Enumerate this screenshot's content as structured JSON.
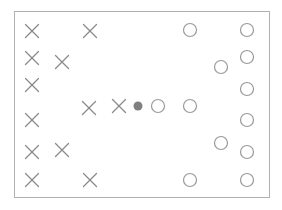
{
  "figure": {
    "title": "",
    "width": 282,
    "height": 210
  },
  "colors": {
    "background": "#ffffff",
    "border_stroke": "#b0b0b0",
    "cross_stroke": "#8a8a8a",
    "circle_stroke": "#9a9a9a",
    "query_fill": "#808080"
  },
  "frame": {
    "x": 14,
    "y": 11,
    "width": 255,
    "height": 186,
    "stroke_width": 1
  },
  "legend": {
    "entries": [
      {
        "name": "class-cross",
        "symbol": "X",
        "label": ""
      },
      {
        "name": "class-circle",
        "symbol": "O",
        "label": ""
      },
      {
        "name": "query-point",
        "symbol": "filled-dot",
        "label": ""
      }
    ]
  },
  "chart_data": {
    "type": "scatter",
    "title": "",
    "xlabel": "",
    "ylabel": "",
    "xlim": [
      14,
      269
    ],
    "ylim": [
      11,
      197
    ],
    "grid": false,
    "legend_position": "none",
    "series": [
      {
        "name": "class-cross",
        "marker": "x",
        "color": "#8a8a8a",
        "size": 13,
        "points": [
          {
            "x": 32,
            "y": 31
          },
          {
            "x": 90,
            "y": 31
          },
          {
            "x": 32,
            "y": 58
          },
          {
            "x": 62,
            "y": 62
          },
          {
            "x": 32,
            "y": 85
          },
          {
            "x": 89,
            "y": 108
          },
          {
            "x": 119,
            "y": 106
          },
          {
            "x": 32,
            "y": 120
          },
          {
            "x": 32,
            "y": 152
          },
          {
            "x": 62,
            "y": 150
          },
          {
            "x": 32,
            "y": 180
          },
          {
            "x": 90,
            "y": 180
          }
        ]
      },
      {
        "name": "class-circle",
        "marker": "o",
        "color": "#9a9a9a",
        "size": 13,
        "points": [
          {
            "x": 190,
            "y": 30
          },
          {
            "x": 247,
            "y": 30
          },
          {
            "x": 221,
            "y": 67
          },
          {
            "x": 247,
            "y": 57
          },
          {
            "x": 247,
            "y": 89
          },
          {
            "x": 158,
            "y": 106
          },
          {
            "x": 190,
            "y": 106
          },
          {
            "x": 247,
            "y": 120
          },
          {
            "x": 221,
            "y": 143
          },
          {
            "x": 247,
            "y": 152
          },
          {
            "x": 190,
            "y": 180
          },
          {
            "x": 247,
            "y": 180
          }
        ]
      },
      {
        "name": "query-point",
        "marker": "filled-dot",
        "color": "#808080",
        "size": 9,
        "points": [
          {
            "x": 138,
            "y": 106
          }
        ]
      }
    ]
  }
}
